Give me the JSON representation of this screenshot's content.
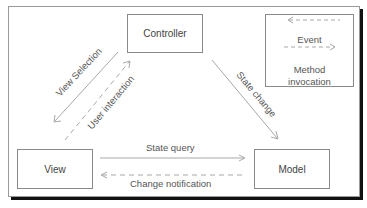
{
  "diagram": {
    "nodes": {
      "controller": "Controller",
      "view": "View",
      "model": "Model"
    },
    "edges": {
      "view_selection": "View Selection",
      "user_interaction": "User interaction",
      "state_change": "State change",
      "state_query": "State query",
      "change_notification": "Change notification"
    },
    "legend": {
      "event": "Event",
      "method_line1": "Method",
      "method_line2": "invocation"
    },
    "colors": {
      "line": "#a8a8a8",
      "border": "#8a8a8a",
      "shadow": "#111111"
    }
  }
}
